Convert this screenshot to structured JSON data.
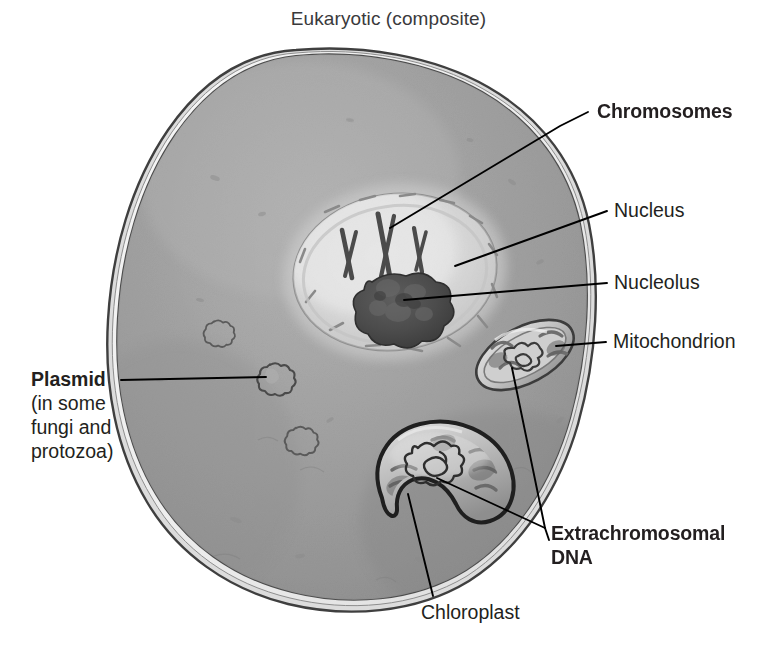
{
  "figure": {
    "title": "Eukaryotic (composite)",
    "background_color": "#ffffff",
    "cytoplasm_color": "#9a9a9a",
    "membrane_color": "#4a4a4a",
    "label_color": "#231f20",
    "title_color": "#3a3a3c"
  },
  "labels": {
    "chromosomes": {
      "text": "Chromosomes",
      "weight": "bold"
    },
    "nucleus": {
      "text": "Nucleus",
      "weight": "regular"
    },
    "nucleolus": {
      "text": "Nucleolus",
      "weight": "regular"
    },
    "mitochondrion": {
      "text": "Mitochondrion",
      "weight": "regular"
    },
    "extrachromosomal_dna": {
      "line1": "Extrachromosomal",
      "line2": "DNA",
      "weight": "bold"
    },
    "chloroplast": {
      "text": "Chloroplast",
      "weight": "regular"
    },
    "plasmid": {
      "head": "Plasmid",
      "sub_line1": "(in some",
      "sub_line2": "fungi and",
      "sub_line3": "protozoa)",
      "weight": "bold"
    }
  },
  "structures": [
    {
      "name": "cell-membrane",
      "label_ref": "none"
    },
    {
      "name": "cytoplasm",
      "label_ref": "none"
    },
    {
      "name": "nucleus",
      "label_ref": "nucleus"
    },
    {
      "name": "nucleolus",
      "label_ref": "nucleolus"
    },
    {
      "name": "chromosomes",
      "label_ref": "chromosomes"
    },
    {
      "name": "mitochondrion",
      "label_ref": "mitochondrion"
    },
    {
      "name": "chloroplast",
      "label_ref": "chloroplast"
    },
    {
      "name": "plasmid",
      "label_ref": "plasmid"
    },
    {
      "name": "mitochondrial-dna",
      "label_ref": "extrachromosomal_dna"
    },
    {
      "name": "chloroplast-dna",
      "label_ref": "extrachromosomal_dna"
    }
  ]
}
